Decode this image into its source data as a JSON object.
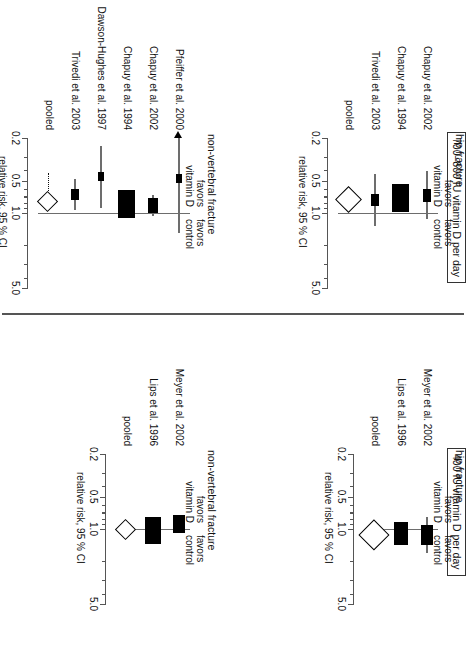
{
  "figure": {
    "groups": [
      {
        "id": "g400",
        "dose_label": "400 IU vitamin D per day",
        "panels": [
          {
            "id": "p400hip",
            "outcome": "hip fracture",
            "favors_left": "favors",
            "favors_left2": "vitamin D",
            "favors_right": "favors",
            "favors_right2": "control",
            "axis_label": "relative risk, 95 % CI",
            "ticks": [
              "0.2",
              "0.5",
              "1.0",
              "5.0"
            ],
            "studies": [
              {
                "label": "Meyer et al. 2002",
                "rr": 1.13,
                "lo": 0.77,
                "hi": 1.68,
                "weight": 0.62
              },
              {
                "label": "Lips et al. 1996",
                "rr": 1.1,
                "lo": 0.87,
                "hi": 1.41,
                "weight": 0.78
              }
            ],
            "pooled": {
              "label": "pooled",
              "rr": 1.1,
              "lo": 0.89,
              "hi": 1.36
            }
          },
          {
            "id": "p400nv",
            "outcome": "non-vertebral fracture",
            "favors_left": "favors",
            "favors_left2": "vitamin D",
            "favors_right": "favors",
            "favors_right2": "control",
            "axis_label": "relative risk, 95 % CI",
            "ticks": [
              "0.2",
              "0.5",
              "1.0",
              "5.0"
            ],
            "studies": [
              {
                "label": "Meyer et al. 2002",
                "rr": 0.9,
                "lo": 0.76,
                "hi": 1.07,
                "weight": 0.55
              },
              {
                "label": "Lips et al. 1996",
                "rr": 1.03,
                "lo": 0.86,
                "hi": 1.24,
                "weight": 0.95
              }
            ],
            "pooled": {
              "label": "pooled",
              "rr": 0.99,
              "lo": 0.88,
              "hi": 1.11
            }
          }
        ]
      },
      {
        "id": "g700",
        "dose_label": "700–800 IU vitamin D per day",
        "panels": [
          {
            "id": "p700hip",
            "outcome": "hip fracture",
            "favors_left": "favors",
            "favors_left2": "vitamin D",
            "favors_right": "favors",
            "favors_right2": "control",
            "axis_label": "relative risk, 95 % CI",
            "ticks": [
              "0.2",
              "0.5",
              "1.0",
              "5.0"
            ],
            "studies": [
              {
                "label": "Chapuy et al. 2002",
                "rr": 0.69,
                "lo": 0.41,
                "hi": 1.15,
                "weight": 0.3
              },
              {
                "label": "Chapuy et al. 1994",
                "rr": 0.73,
                "lo": 0.62,
                "hi": 0.86,
                "weight": 1.0
              },
              {
                "label": "Trivedi et al. 2003",
                "rr": 0.76,
                "lo": 0.43,
                "hi": 1.33,
                "weight": 0.27
              }
            ],
            "pooled": {
              "label": "pooled",
              "rr": 0.74,
              "lo": 0.61,
              "hi": 0.88
            }
          },
          {
            "id": "p700nv",
            "outcome": "non-vertebral fracture",
            "favors_left": "favors",
            "favors_left2": "vitamin D",
            "favors_right": "favors",
            "favors_right2": "control",
            "axis_label": "relative risk, 95 % CI",
            "ticks": [
              "0.2",
              "0.5",
              "1.0",
              "5.0"
            ],
            "studies": [
              {
                "label": "Pfeiffer et al. 2000",
                "rr": 0.48,
                "lo": 0.08,
                "hi": 1.55,
                "weight": 0.14,
                "arrow_low": true
              },
              {
                "label": "Chapuy et al. 2002",
                "rr": 0.85,
                "lo": 0.68,
                "hi": 1.06,
                "weight": 0.42
              },
              {
                "label": "Chapuy et al. 1994",
                "rr": 0.83,
                "lo": 0.72,
                "hi": 0.96,
                "weight": 1.0
              },
              {
                "label": "Dawson-Hughes et al. 1997",
                "rr": 0.46,
                "lo": 0.24,
                "hi": 0.9,
                "weight": 0.15
              },
              {
                "label": "Trivedi et al. 2003",
                "rr": 0.67,
                "lo": 0.48,
                "hi": 0.93,
                "weight": 0.22
              }
            ],
            "pooled": {
              "label": "pooled",
              "rr": 0.77,
              "lo": 0.68,
              "hi": 0.87
            }
          }
        ]
      }
    ]
  },
  "chart_data": {
    "type": "scatter",
    "xlabel": "relative risk, 95 % CI",
    "ylabel": "",
    "xscale": "log",
    "xlim": [
      0.2,
      5.0
    ],
    "xticks": [
      0.2,
      0.5,
      1.0,
      5.0
    ],
    "xticklabels": [
      "0.2",
      "0.5",
      "1.0",
      "5.0"
    ],
    "grid": false,
    "legend": "none",
    "annotations": [
      "favors vitamin D",
      "favors control"
    ],
    "panels": [
      {
        "panel": "400 IU vitamin D per day — hip fracture",
        "categories": [
          "Meyer et al. 2002",
          "Lips et al. 1996",
          "pooled"
        ],
        "rr": [
          1.13,
          1.1,
          1.1
        ],
        "ci_lo": [
          0.77,
          0.87,
          0.89
        ],
        "ci_hi": [
          1.68,
          1.41,
          1.36
        ]
      },
      {
        "panel": "400 IU vitamin D per day — non-vertebral fracture",
        "categories": [
          "Meyer et al. 2002",
          "Lips et al. 1996",
          "pooled"
        ],
        "rr": [
          0.9,
          1.03,
          0.99
        ],
        "ci_lo": [
          0.76,
          0.86,
          0.88
        ],
        "ci_hi": [
          1.07,
          1.24,
          1.11
        ]
      },
      {
        "panel": "700–800 IU vitamin D per day — hip fracture",
        "categories": [
          "Chapuy et al. 2002",
          "Chapuy et al. 1994",
          "Trivedi et al. 2003",
          "pooled"
        ],
        "rr": [
          0.69,
          0.73,
          0.76,
          0.74
        ],
        "ci_lo": [
          0.41,
          0.62,
          0.43,
          0.61
        ],
        "ci_hi": [
          1.15,
          0.86,
          1.33,
          0.88
        ]
      },
      {
        "panel": "700–800 IU vitamin D per day — non-vertebral fracture",
        "categories": [
          "Pfeiffer et al. 2000",
          "Chapuy et al. 2002",
          "Chapuy et al. 1994",
          "Dawson-Hughes et al. 1997",
          "Trivedi et al. 2003",
          "pooled"
        ],
        "rr": [
          0.48,
          0.85,
          0.83,
          0.46,
          0.67,
          0.77
        ],
        "ci_lo": [
          0.08,
          0.68,
          0.72,
          0.24,
          0.48,
          0.68
        ],
        "ci_hi": [
          1.55,
          1.06,
          0.96,
          0.9,
          0.93,
          0.87
        ]
      }
    ]
  }
}
